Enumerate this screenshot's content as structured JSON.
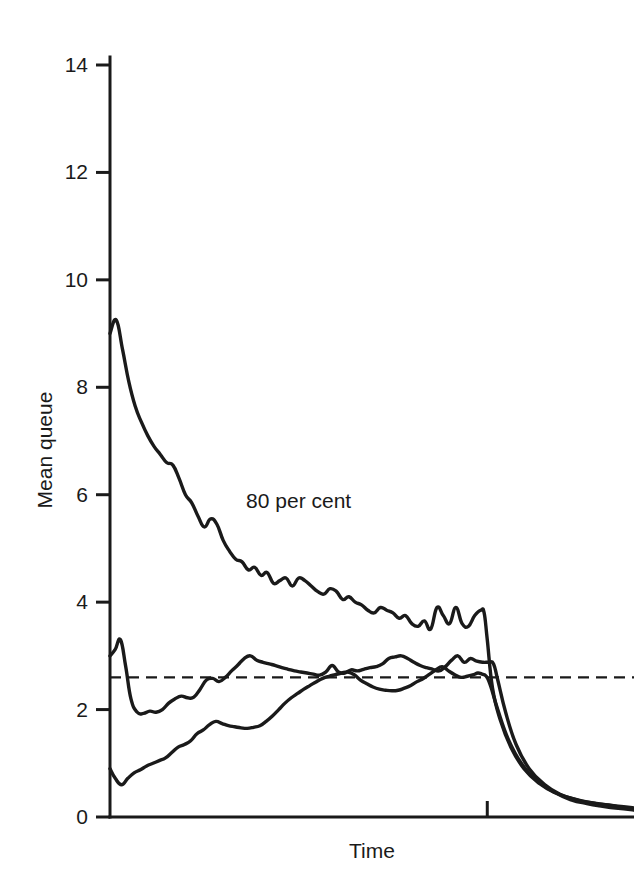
{
  "chart_data": {
    "type": "line",
    "title": "",
    "xlabel": "Time",
    "ylabel": "Mean queue",
    "ylim": [
      0,
      14.6
    ],
    "xlim": [
      0,
      100
    ],
    "yticks": [
      0,
      2,
      4,
      6,
      8,
      10,
      12,
      14
    ],
    "ytick_labels": [
      "0",
      "2",
      "4",
      "6",
      "8",
      "10",
      "12",
      "14"
    ],
    "xticks": [
      72
    ],
    "xtick_labels": [
      ""
    ],
    "grid": false,
    "legend": "none",
    "annotations": [
      {
        "text": "80 per cent",
        "x": 36,
        "y": 5.75
      }
    ],
    "reference_lines": [
      {
        "orientation": "horizontal",
        "value": 2.6,
        "style": "dashed",
        "label": ""
      }
    ],
    "series": [
      {
        "name": "upper",
        "x": [
          0,
          1.2,
          2.4,
          3.6,
          4.8,
          6.0,
          7.2,
          8.4,
          9.6,
          10.8,
          12.0,
          13.2,
          14.4,
          15.6,
          16.8,
          18.0,
          19.2,
          20.4,
          21.6,
          22.8,
          24.0,
          25.2,
          26.4,
          27.6,
          28.8,
          30.0,
          31.2,
          32.4,
          33.6,
          34.8,
          36.0,
          37.2,
          38.4,
          39.6,
          40.8,
          42.0,
          43.2,
          44.4,
          45.6,
          46.8,
          48.0,
          49.2,
          50.4,
          51.6,
          52.8,
          54.0,
          55.2,
          56.4,
          57.6,
          58.8,
          60.0,
          61.2,
          62.4,
          63.6,
          64.8,
          66.0,
          67.2,
          68.4,
          69.6,
          70.8,
          71.4,
          72.0,
          73.0,
          74.5,
          76.5,
          79.0,
          82.0,
          85.0,
          88.0,
          91.0,
          94.0,
          97.0,
          100.0
        ],
        "values": [
          9.0,
          9.25,
          8.7,
          8.1,
          7.65,
          7.35,
          7.1,
          6.9,
          6.75,
          6.6,
          6.55,
          6.3,
          6.0,
          5.85,
          5.6,
          5.4,
          5.55,
          5.45,
          5.15,
          4.95,
          4.8,
          4.75,
          4.6,
          4.65,
          4.5,
          4.55,
          4.35,
          4.4,
          4.45,
          4.3,
          4.45,
          4.4,
          4.3,
          4.2,
          4.15,
          4.25,
          4.2,
          4.05,
          4.1,
          4.0,
          3.95,
          3.85,
          3.8,
          3.9,
          3.85,
          3.8,
          3.7,
          3.75,
          3.6,
          3.55,
          3.65,
          3.5,
          3.9,
          3.75,
          3.6,
          3.9,
          3.6,
          3.55,
          3.75,
          3.85,
          3.8,
          3.3,
          2.4,
          1.8,
          1.3,
          0.9,
          0.62,
          0.45,
          0.35,
          0.28,
          0.24,
          0.2,
          0.17
        ],
        "style": "solid"
      },
      {
        "name": "middle",
        "x": [
          0,
          1.0,
          2.0,
          3.0,
          4.0,
          5.2,
          6.4,
          7.6,
          8.8,
          10.0,
          11.2,
          12.4,
          13.6,
          14.8,
          16.0,
          17.2,
          18.4,
          19.6,
          20.8,
          22.0,
          23.2,
          24.4,
          25.6,
          26.8,
          28.0,
          29.2,
          30.4,
          31.6,
          32.8,
          34.0,
          35.2,
          36.4,
          37.6,
          38.8,
          40.0,
          41.2,
          42.4,
          43.6,
          44.8,
          46.0,
          47.2,
          48.4,
          49.6,
          50.8,
          52.0,
          53.2,
          54.4,
          55.6,
          56.8,
          58.0,
          59.2,
          60.4,
          61.6,
          62.8,
          64.0,
          65.2,
          66.4,
          67.6,
          68.8,
          70.0,
          71.2,
          72.4,
          73.2,
          74.0,
          75.5,
          77.5,
          80.0,
          83.0,
          86.0,
          89.0,
          92.0,
          95.0,
          97.5,
          100.0
        ],
        "values": [
          3.0,
          3.12,
          3.3,
          2.8,
          2.2,
          1.95,
          1.93,
          1.97,
          1.95,
          2.0,
          2.12,
          2.2,
          2.25,
          2.22,
          2.23,
          2.38,
          2.55,
          2.58,
          2.52,
          2.6,
          2.72,
          2.83,
          2.95,
          3.0,
          2.92,
          2.88,
          2.85,
          2.82,
          2.78,
          2.75,
          2.72,
          2.7,
          2.68,
          2.66,
          2.64,
          2.7,
          2.82,
          2.7,
          2.68,
          2.74,
          2.72,
          2.75,
          2.78,
          2.8,
          2.85,
          2.95,
          2.98,
          3.0,
          2.95,
          2.88,
          2.82,
          2.78,
          2.75,
          2.72,
          2.8,
          2.92,
          3.0,
          2.88,
          2.95,
          2.9,
          2.88,
          2.88,
          2.85,
          2.55,
          1.95,
          1.35,
          0.9,
          0.6,
          0.42,
          0.32,
          0.26,
          0.22,
          0.18,
          0.14
        ],
        "style": "solid"
      },
      {
        "name": "lower",
        "x": [
          0,
          1.0,
          2.2,
          3.4,
          4.6,
          5.8,
          7.0,
          8.2,
          9.4,
          10.6,
          11.8,
          13.0,
          14.2,
          15.4,
          16.6,
          17.8,
          19.0,
          20.2,
          21.4,
          22.6,
          23.8,
          25.0,
          26.2,
          27.4,
          28.6,
          29.8,
          31.0,
          32.2,
          33.4,
          34.6,
          35.8,
          37.0,
          38.2,
          39.4,
          40.6,
          41.8,
          43.0,
          44.2,
          45.4,
          46.6,
          47.8,
          49.0,
          50.2,
          51.4,
          52.6,
          53.8,
          55.0,
          56.2,
          57.4,
          58.6,
          59.8,
          61.0,
          62.2,
          63.4,
          64.6,
          65.8,
          67.0,
          68.2,
          69.4,
          70.2,
          71.0,
          71.8,
          72.6,
          74.0,
          76.0,
          78.5,
          81.5,
          85.0,
          88.0,
          91.0,
          94.0,
          97.0,
          100.0
        ],
        "values": [
          0.9,
          0.72,
          0.6,
          0.72,
          0.82,
          0.88,
          0.95,
          1.0,
          1.05,
          1.1,
          1.2,
          1.3,
          1.35,
          1.42,
          1.55,
          1.62,
          1.72,
          1.78,
          1.74,
          1.7,
          1.68,
          1.66,
          1.65,
          1.67,
          1.7,
          1.78,
          1.88,
          2.0,
          2.12,
          2.22,
          2.3,
          2.38,
          2.45,
          2.52,
          2.58,
          2.62,
          2.65,
          2.68,
          2.7,
          2.65,
          2.55,
          2.48,
          2.42,
          2.38,
          2.36,
          2.35,
          2.36,
          2.4,
          2.45,
          2.52,
          2.58,
          2.66,
          2.74,
          2.8,
          2.72,
          2.65,
          2.6,
          2.62,
          2.65,
          2.68,
          2.66,
          2.62,
          2.45,
          2.0,
          1.45,
          1.0,
          0.68,
          0.45,
          0.32,
          0.25,
          0.2,
          0.16,
          0.13
        ],
        "style": "solid"
      }
    ]
  },
  "figure": {
    "background_color": "#ffffff",
    "line_color": "#1a1a1a",
    "axis_color": "#1a1a1a"
  }
}
